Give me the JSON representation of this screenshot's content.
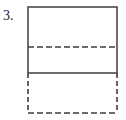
{
  "figure": {
    "item_number": "3.",
    "caption": "",
    "background_color": "#ffffff",
    "stroke_color": "#4a4a4a",
    "dash_color": "#3c3c3c"
  },
  "chart_data": {
    "type": "diagram",
    "title": "",
    "subtitle": "",
    "xlabel": "",
    "ylabel": "",
    "canvas": {
      "width": 126,
      "height": 120
    },
    "shapes": [
      {
        "name": "solid-rectangle",
        "kind": "rect",
        "stroke_style": "solid",
        "x": 28,
        "y": 7,
        "width": 89,
        "height": 66,
        "stroke_width": 1.6,
        "fill": "none"
      },
      {
        "name": "interior-dashed-line",
        "kind": "line",
        "stroke_style": "dashed",
        "x1": 28,
        "y1": 47,
        "x2": 117,
        "y2": 47,
        "stroke_width": 1.6,
        "dash_pattern": [
          6,
          3
        ]
      },
      {
        "name": "dashed-rectangle-left-side",
        "kind": "line",
        "stroke_style": "dashed",
        "x1": 28,
        "y1": 73,
        "x2": 28,
        "y2": 113,
        "stroke_width": 1.6,
        "dash_pattern": [
          5,
          3
        ]
      },
      {
        "name": "dashed-rectangle-right-side",
        "kind": "line",
        "stroke_style": "dashed",
        "x1": 117,
        "y1": 73,
        "x2": 117,
        "y2": 113,
        "stroke_width": 1.6,
        "dash_pattern": [
          5,
          3
        ]
      },
      {
        "name": "dashed-rectangle-bottom-side",
        "kind": "line",
        "stroke_style": "dashed",
        "x1": 28,
        "y1": 113,
        "x2": 117,
        "y2": 113,
        "stroke_width": 1.6,
        "dash_pattern": [
          6,
          3
        ]
      }
    ],
    "labels": [
      {
        "name": "item-number",
        "text": "3.",
        "x": 4,
        "y": 18
      }
    ],
    "grid": false,
    "legend": null
  }
}
